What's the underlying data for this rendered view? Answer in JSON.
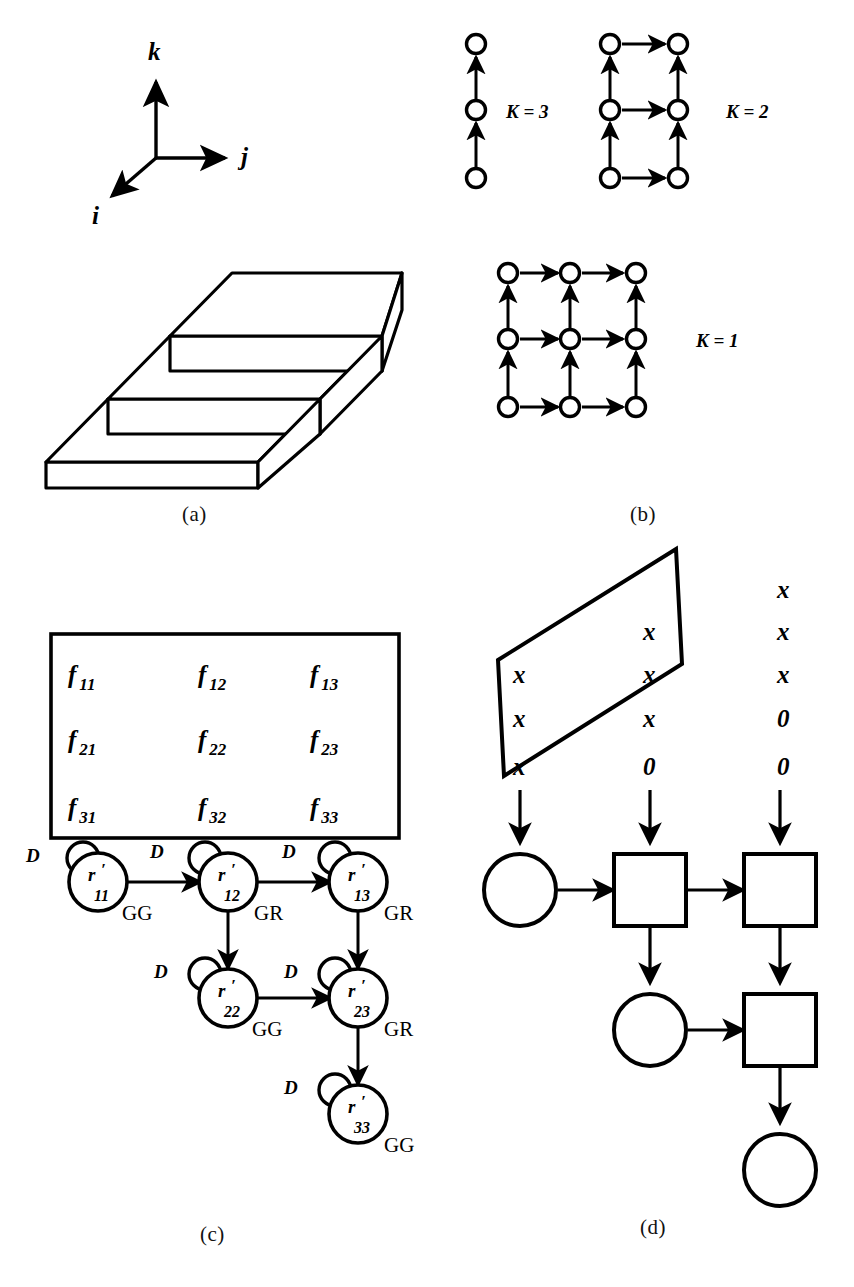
{
  "figure": {
    "panels": [
      {
        "id": "a",
        "caption": "(a)",
        "desc": "isometric three-tier stepped block with ijk axis triad"
      },
      {
        "id": "b",
        "caption": "(b)",
        "desc": "three dependence graphs for K = 3, K = 2, K = 1"
      },
      {
        "id": "c",
        "caption": "(c)",
        "desc": "f matrix with state transition graph of r' nodes"
      },
      {
        "id": "d",
        "caption": "(d)",
        "desc": "skewed parallelogram of x/0 entries with circle-square flow array"
      }
    ]
  },
  "panel_a": {
    "axes": [
      {
        "name": "k-axis",
        "label": "k",
        "direction": "up"
      },
      {
        "name": "j-axis",
        "label": "j",
        "direction": "right"
      },
      {
        "name": "i-axis",
        "label": "i",
        "direction": "down-left"
      }
    ],
    "tiers": 3
  },
  "panel_b": {
    "graphs": [
      {
        "name": "K = 3",
        "label": "K = 3",
        "rows": 3,
        "cols": 1,
        "nodes": [
          [
            0,
            0
          ],
          [
            0,
            1
          ],
          [
            0,
            2
          ]
        ],
        "edges_up": 3,
        "edges_right": 0
      },
      {
        "name": "K = 2",
        "label": "K = 2",
        "rows": 3,
        "cols": 2,
        "nodes": [
          [
            0,
            0
          ],
          [
            1,
            0
          ],
          [
            0,
            1
          ],
          [
            1,
            1
          ],
          [
            0,
            2
          ],
          [
            1,
            2
          ]
        ],
        "edges_up": 4,
        "edges_right": 3
      },
      {
        "name": "K = 1",
        "label": "K = 1",
        "rows": 3,
        "cols": 3,
        "nodes": [
          [
            0,
            0
          ],
          [
            1,
            0
          ],
          [
            2,
            0
          ],
          [
            0,
            1
          ],
          [
            1,
            1
          ],
          [
            2,
            1
          ],
          [
            0,
            2
          ],
          [
            1,
            2
          ],
          [
            2,
            2
          ]
        ],
        "edges_up": 6,
        "edges_right": 6
      }
    ]
  },
  "panel_c": {
    "matrix": {
      "rows": [
        [
          {
            "base": "f",
            "sub": "11"
          },
          {
            "base": "f",
            "sub": "12"
          },
          {
            "base": "f",
            "sub": "13"
          }
        ],
        [
          {
            "base": "f",
            "sub": "21"
          },
          {
            "base": "f",
            "sub": "22"
          },
          {
            "base": "f",
            "sub": "23"
          }
        ],
        [
          {
            "base": "f",
            "sub": "31"
          },
          {
            "base": "f",
            "sub": "32"
          },
          {
            "base": "f",
            "sub": "33"
          }
        ]
      ]
    },
    "graph": {
      "nodes": [
        {
          "id": "r11",
          "base": "r",
          "prime": "′",
          "sub": "11",
          "self_loop_label": "D",
          "edge_label": "GG"
        },
        {
          "id": "r12",
          "base": "r",
          "prime": "′",
          "sub": "12",
          "self_loop_label": "D",
          "edge_label": "GR"
        },
        {
          "id": "r13",
          "base": "r",
          "prime": "′",
          "sub": "13",
          "self_loop_label": "D",
          "edge_label": "GR"
        },
        {
          "id": "r22",
          "base": "r",
          "prime": "′",
          "sub": "22",
          "self_loop_label": "D",
          "edge_label": "GG"
        },
        {
          "id": "r23",
          "base": "r",
          "prime": "′",
          "sub": "23",
          "self_loop_label": "D",
          "edge_label": "GR"
        },
        {
          "id": "r33",
          "base": "r",
          "prime": "′",
          "sub": "33",
          "self_loop_label": "D",
          "edge_label": "GG"
        }
      ],
      "transition_labels": [
        "D",
        "D",
        "D",
        "D",
        "D",
        "D"
      ],
      "edge_labels": [
        "GG",
        "GR",
        "GR",
        "GG",
        "GR",
        "GG"
      ]
    }
  },
  "panel_d": {
    "parallelogram": {
      "columns": [
        {
          "index": 1,
          "values": [
            "x",
            "x",
            "x"
          ]
        },
        {
          "index": 2,
          "values": [
            "x",
            "x",
            "x",
            "0"
          ]
        },
        {
          "index": 3,
          "values": [
            "x",
            "x",
            "x",
            "0",
            "0"
          ]
        }
      ],
      "entries_flat": [
        "x",
        "x",
        "x",
        "x",
        "x",
        "x",
        "x",
        "x",
        "x",
        "0",
        "0",
        "0"
      ],
      "symbol_nonzero": "x",
      "symbol_zero": "0"
    },
    "flow": {
      "rows": [
        [
          {
            "shape": "circle"
          },
          {
            "shape": "square"
          },
          {
            "shape": "square"
          }
        ],
        [
          {
            "shape": "circle"
          },
          {
            "shape": "square"
          }
        ],
        [
          {
            "shape": "circle"
          }
        ]
      ],
      "input_arrows": 3
    }
  },
  "style": {
    "ink": "#000000",
    "paper": "#ffffff"
  }
}
